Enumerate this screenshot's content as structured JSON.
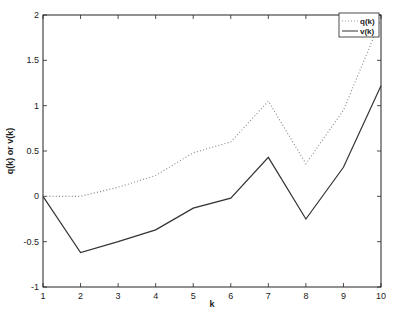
{
  "chart_data": {
    "type": "line",
    "title": "",
    "xlabel": "k",
    "ylabel": "q(k) or v(k)",
    "x": [
      1,
      2,
      3,
      4,
      5,
      6,
      7,
      8,
      9,
      10
    ],
    "xlim": [
      1,
      10
    ],
    "ylim": [
      -1,
      2
    ],
    "xticks": [
      "1",
      "2",
      "3",
      "4",
      "5",
      "6",
      "7",
      "8",
      "9",
      "10"
    ],
    "yticks": [
      "-1",
      "-0.5",
      "0",
      "0.5",
      "1",
      "1.5",
      "2"
    ],
    "grid": false,
    "legend_position": "upper right",
    "series": [
      {
        "name": "q(k)",
        "style": "dotted",
        "color": "#888888",
        "values": [
          0,
          0.0,
          0.1,
          0.23,
          0.48,
          0.6,
          1.05,
          0.36,
          0.95,
          1.95
        ]
      },
      {
        "name": "v(k)",
        "style": "solid",
        "color": "#333333",
        "values": [
          0,
          -0.62,
          -0.5,
          -0.37,
          -0.13,
          -0.02,
          0.43,
          -0.25,
          0.32,
          1.22
        ]
      }
    ]
  }
}
